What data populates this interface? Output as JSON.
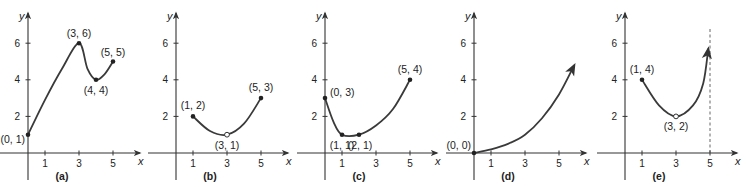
{
  "chart_data": [
    {
      "type": "line",
      "panel": "(a)",
      "xlabel": "x",
      "ylabel": "y",
      "x_ticks": [
        "1",
        "3",
        "5"
      ],
      "y_ticks": [
        "2",
        "4",
        "6"
      ],
      "xlim": [
        0,
        5.8
      ],
      "ylim": [
        0,
        7
      ],
      "grid": false,
      "points": [
        {
          "x": 0,
          "y": 1,
          "label": "(0, 1)",
          "marker": "filled"
        },
        {
          "x": 3,
          "y": 6,
          "label": "(3, 6)",
          "marker": "filled"
        },
        {
          "x": 4,
          "y": 4,
          "label": "(4, 4)",
          "marker": "filled"
        },
        {
          "x": 5,
          "y": 5,
          "label": "(5, 5)",
          "marker": "filled"
        }
      ],
      "curve": [
        [
          0,
          1
        ],
        [
          1,
          2.9
        ],
        [
          2,
          4.6
        ],
        [
          3,
          6
        ],
        [
          3.5,
          4.6
        ],
        [
          4,
          4
        ],
        [
          4.5,
          4.3
        ],
        [
          5,
          5
        ]
      ]
    },
    {
      "type": "line",
      "panel": "(b)",
      "xlabel": "x",
      "ylabel": "y",
      "x_ticks": [
        "1",
        "3",
        "5"
      ],
      "y_ticks": [
        "2",
        "4",
        "6"
      ],
      "xlim": [
        0,
        5.8
      ],
      "ylim": [
        0,
        7
      ],
      "grid": false,
      "points": [
        {
          "x": 1,
          "y": 2,
          "label": "(1, 2)",
          "marker": "filled"
        },
        {
          "x": 3,
          "y": 1,
          "label": "(3, 1)",
          "marker": "open"
        },
        {
          "x": 5,
          "y": 3,
          "label": "(5, 3)",
          "marker": "filled"
        }
      ],
      "curve": [
        [
          1,
          2
        ],
        [
          2,
          1.2
        ],
        [
          3,
          1
        ],
        [
          4,
          1.6
        ],
        [
          5,
          3
        ]
      ]
    },
    {
      "type": "line",
      "panel": "(c)",
      "xlabel": "x",
      "ylabel": "y",
      "x_ticks": [
        "1",
        "3",
        "5"
      ],
      "y_ticks": [
        "2",
        "4",
        "6"
      ],
      "xlim": [
        0,
        5.8
      ],
      "ylim": [
        0,
        7
      ],
      "grid": false,
      "points": [
        {
          "x": 0,
          "y": 3,
          "label": "(0, 3)",
          "marker": "filled"
        },
        {
          "x": 1,
          "y": 1,
          "label": "(1, 1)",
          "marker": "filled"
        },
        {
          "x": 2,
          "y": 1,
          "label": "(2, 1)",
          "marker": "filled"
        },
        {
          "x": 5,
          "y": 4,
          "label": "(5, 4)",
          "marker": "filled"
        }
      ],
      "curve": [
        [
          0,
          3
        ],
        [
          0.5,
          1.7
        ],
        [
          1,
          1
        ],
        [
          2,
          1
        ],
        [
          3,
          1.5
        ],
        [
          4,
          2.4
        ],
        [
          5,
          4
        ]
      ]
    },
    {
      "type": "line",
      "panel": "(d)",
      "xlabel": "x",
      "ylabel": "y",
      "x_ticks": [
        "1",
        "3",
        "5"
      ],
      "y_ticks": [
        "2",
        "4",
        "6"
      ],
      "xlim": [
        0,
        5.8
      ],
      "ylim": [
        0,
        7
      ],
      "grid": false,
      "points": [
        {
          "x": 0,
          "y": 0,
          "label": "(0, 0)",
          "marker": "filled"
        }
      ],
      "curve": [
        [
          0,
          0
        ],
        [
          1,
          0.2
        ],
        [
          2,
          0.5
        ],
        [
          3,
          1
        ],
        [
          4,
          1.9
        ],
        [
          5,
          3.2
        ],
        [
          5.9,
          4.8
        ]
      ],
      "end_arrow": true
    },
    {
      "type": "line",
      "panel": "(e)",
      "xlabel": "x",
      "ylabel": "y",
      "x_ticks": [
        "1",
        "3",
        "5"
      ],
      "y_ticks": [
        "2",
        "4",
        "6"
      ],
      "xlim": [
        0,
        5.8
      ],
      "ylim": [
        0,
        7
      ],
      "grid": false,
      "points": [
        {
          "x": 1,
          "y": 4,
          "label": "(1, 4)",
          "marker": "filled"
        },
        {
          "x": 3,
          "y": 2,
          "label": "(3, 2)",
          "marker": "open"
        }
      ],
      "curve": [
        [
          1,
          4
        ],
        [
          2,
          2.6
        ],
        [
          3,
          2
        ],
        [
          4,
          2.6
        ],
        [
          4.6,
          3.8
        ],
        [
          4.9,
          5.7
        ]
      ],
      "end_arrow": true,
      "vertical_asymptote": {
        "x": 5,
        "style": "dashed"
      }
    }
  ]
}
